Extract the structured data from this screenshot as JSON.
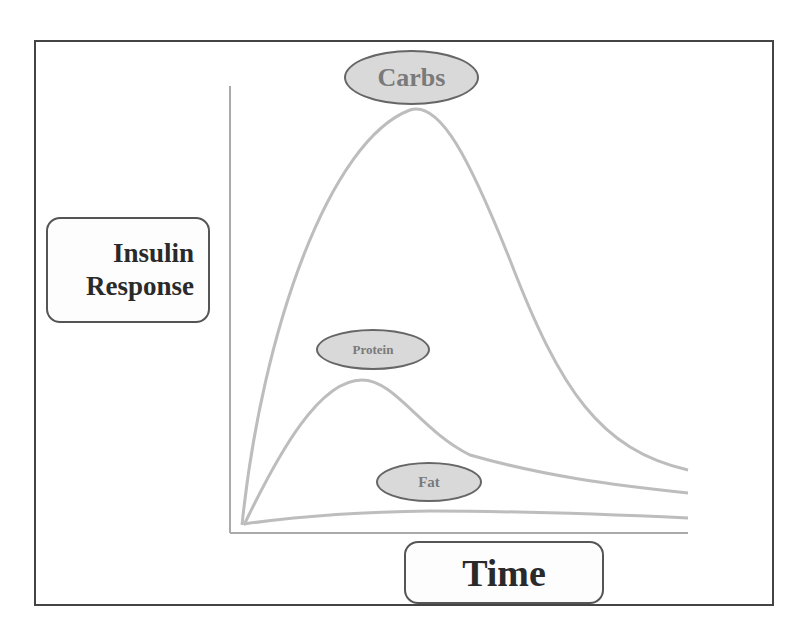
{
  "diagram": {
    "y_axis_label_line1": "Insulin",
    "y_axis_label_line2": "Response",
    "x_axis_label": "Time",
    "curves": [
      {
        "name": "Carbs",
        "color": "#b8b8b8",
        "peak": "high"
      },
      {
        "name": "Protein",
        "color": "#b8b8b8",
        "peak": "medium"
      },
      {
        "name": "Fat",
        "color": "#b8b8b8",
        "peak": "low"
      }
    ],
    "labels": {
      "carbs": "Carbs",
      "protein": "Protein",
      "fat": "Fat"
    }
  }
}
